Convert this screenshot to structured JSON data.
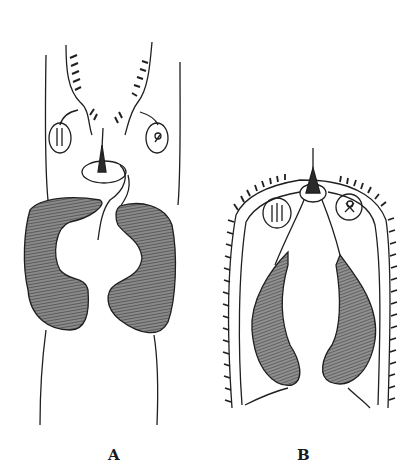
{
  "figure": {
    "panels": [
      {
        "id": "A",
        "label": "A"
      },
      {
        "id": "B",
        "label": "B"
      }
    ],
    "colors": {
      "ink": "#1f1f1f",
      "shade": "#6e6e6e",
      "shade_dark": "#4a4a4a",
      "background": "#ffffff"
    }
  }
}
